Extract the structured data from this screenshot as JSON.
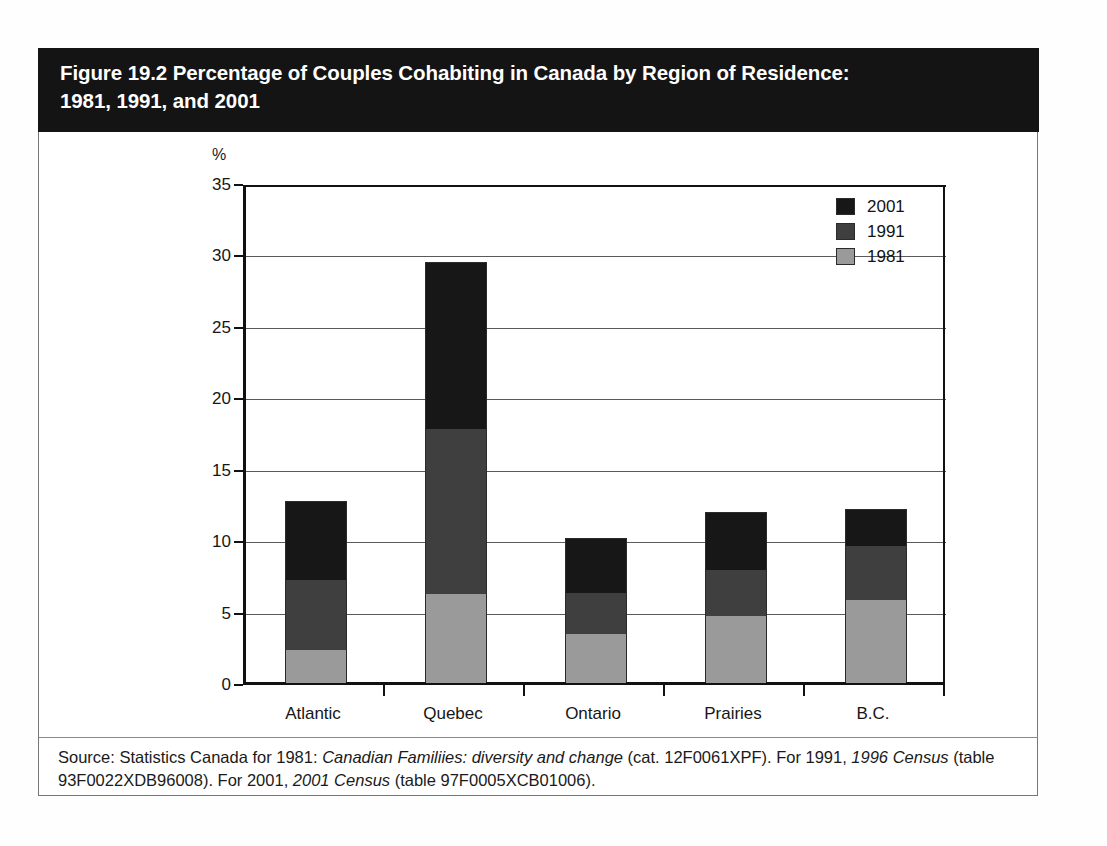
{
  "figure": {
    "title": "Figure 19.2 Percentage of Couples Cohabiting in Canada by Region of Residence:\n1981, 1991, and 2001",
    "source_line1_a": "Source: Statistics Canada for 1981: ",
    "source_line1_italic1": "Canadian Familiies: diversity and change",
    "source_line1_b": " (cat. 12F0061XPF). For 1991, ",
    "source_line1_italic2": "1996 Census",
    "source_line2_a": " (table 93F0022XDB96008). For 2001, ",
    "source_line2_italic1": "2001 Census",
    "source_line2_b": " (table 97F0005XCB01006)."
  },
  "legend": {
    "items": [
      {
        "label": "2001",
        "color": "#171717"
      },
      {
        "label": "1991",
        "color": "#3f3f3f"
      },
      {
        "label": "1981",
        "color": "#9a9a9a"
      }
    ]
  },
  "chart_data": {
    "type": "bar",
    "stacked": true,
    "title": "Figure 19.2 Percentage of Couples Cohabiting in Canada by Region of Residence: 1981, 1991, and 2001",
    "xlabel": "",
    "ylabel": "%",
    "ylim": [
      0,
      35
    ],
    "ytick_labels": [
      "0",
      "5",
      "10",
      "15",
      "20",
      "25",
      "30",
      "35"
    ],
    "yticks": [
      0,
      5,
      10,
      15,
      20,
      25,
      30,
      35
    ],
    "grid": true,
    "legend_position": "top-right",
    "categories": [
      "Atlantic",
      "Quebec",
      "Ontario",
      "Prairies",
      "B.C."
    ],
    "note": "Segments are stacked visually; each year's value is read as the cumulative top of its segment.",
    "cumulative_tops": {
      "1981": [
        2.3,
        6.2,
        3.4,
        4.7,
        5.8
      ],
      "1991": [
        7.2,
        17.8,
        6.3,
        7.9,
        9.6
      ],
      "2001": [
        12.7,
        29.4,
        10.1,
        11.9,
        12.1
      ]
    },
    "series": [
      {
        "name": "1981",
        "color": "#9a9a9a",
        "values": [
          2.3,
          6.2,
          3.4,
          4.7,
          5.8
        ]
      },
      {
        "name": "1991",
        "color": "#3f3f3f",
        "values": [
          4.9,
          11.6,
          2.9,
          3.2,
          3.8
        ]
      },
      {
        "name": "2001",
        "color": "#171717",
        "values": [
          5.5,
          11.6,
          3.8,
          4.0,
          2.5
        ]
      }
    ]
  }
}
